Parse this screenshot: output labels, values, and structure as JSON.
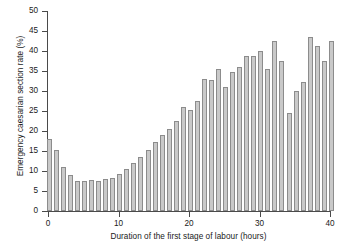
{
  "chart_data": {
    "type": "bar",
    "title": "",
    "xlabel": "Duration of the first stage of labour (hours)",
    "ylabel": "Emergency caesarian section rate (%)",
    "xlim": [
      0,
      40
    ],
    "ylim": [
      0,
      50
    ],
    "xticks": [
      0,
      10,
      20,
      30,
      40
    ],
    "yticks": [
      0,
      5,
      10,
      15,
      20,
      25,
      30,
      35,
      40,
      45,
      50
    ],
    "grid": false,
    "legend": null,
    "bar_color": "#c9c9c9",
    "bar_edge_color": "#8c8c8c",
    "x": [
      0,
      1,
      2,
      3,
      4,
      5,
      6,
      7,
      8,
      9,
      10,
      11,
      12,
      13,
      14,
      15,
      16,
      17,
      18,
      19,
      20,
      21,
      22,
      23,
      24,
      25,
      26,
      27,
      28,
      29,
      30,
      31,
      32,
      33,
      34,
      35,
      36,
      37,
      38,
      39,
      40
    ],
    "categories": [
      "0",
      "1",
      "2",
      "3",
      "4",
      "5",
      "6",
      "7",
      "8",
      "9",
      "10",
      "11",
      "12",
      "13",
      "14",
      "15",
      "16",
      "17",
      "18",
      "19",
      "20",
      "21",
      "22",
      "23",
      "24",
      "25",
      "26",
      "27",
      "28",
      "29",
      "30",
      "31",
      "32",
      "33",
      "34",
      "35",
      "36",
      "37",
      "38",
      "39",
      "40"
    ],
    "values": [
      18.0,
      15.3,
      11.1,
      9.0,
      7.6,
      7.5,
      7.8,
      7.4,
      8.0,
      8.3,
      9.2,
      10.6,
      11.9,
      13.5,
      15.2,
      17.2,
      19.1,
      20.6,
      22.5,
      26.0,
      25.2,
      27.4,
      33.0,
      32.8,
      35.6,
      30.9,
      34.7,
      35.9,
      38.7,
      38.8,
      40.0,
      35.4,
      42.4,
      37.5,
      24.5,
      30.1,
      32.3,
      43.6,
      41.2,
      37.5,
      26.5
    ],
    "last_value": 42.5
  },
  "axis": {
    "y_tick_labels": [
      "0",
      "5",
      "10",
      "15",
      "20",
      "25",
      "30",
      "35",
      "40",
      "45",
      "50"
    ],
    "x_tick_labels": [
      "0",
      "10",
      "20",
      "30",
      "40"
    ]
  }
}
